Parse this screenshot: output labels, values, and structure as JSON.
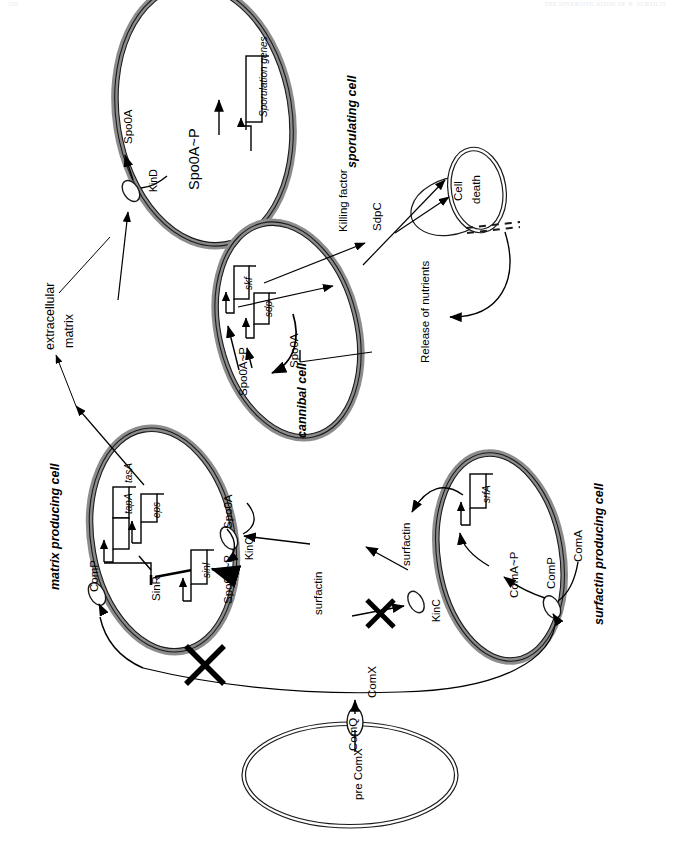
{
  "page": {
    "header_left": "220",
    "header_right": "THE DIVERSIFICATION OF B. SUBTILIS"
  },
  "diagram": {
    "orientation": "rotated-90-ccw",
    "colors": {
      "membrane_fill": "#8c8c8c",
      "membrane_stroke": "#1a1a1a",
      "line": "#000000",
      "background": "#ffffff"
    },
    "cells": [
      {
        "id": "sporulating",
        "title": "sporulating cell",
        "nodes": [
          "Spo0A",
          "KinD",
          "Spo0A~P"
        ],
        "genes": [
          "Sporulation genes"
        ]
      },
      {
        "id": "cannibal",
        "title": "cannibal cell",
        "nodes": [
          "Spo0A~P",
          "Spo0A"
        ],
        "genes": [
          "skf",
          "sdp"
        ]
      },
      {
        "id": "matrix",
        "title": "matrix producing cell",
        "nodes": [
          "ComP",
          "SinR",
          "Spo0A~P",
          "Spo0A",
          "KinC"
        ],
        "genes": [
          "tapA",
          "tasA",
          "eps",
          "sinI"
        ]
      },
      {
        "id": "surfactin",
        "title": "surfactin producing cell",
        "nodes": [
          "surfactin",
          "KinC",
          "ComA~P",
          "ComP",
          "ComA"
        ],
        "genes": [
          "srfA"
        ]
      },
      {
        "id": "dying",
        "title": "",
        "nodes": [
          "Cell",
          "death"
        ],
        "genes": []
      },
      {
        "id": "signalling",
        "title": "",
        "nodes": [
          "pre ComX",
          "ComQ",
          "ComX"
        ],
        "genes": []
      }
    ],
    "labels": {
      "sporulating_cell": "sporulating cell",
      "cannibal_cell": "cannibal cell",
      "matrix_producing_cell": "matrix producing cell",
      "surfactin_producing_cell": "surfactin producing cell",
      "extracellular": "extracellular",
      "matrix": "matrix",
      "spo0a": "Spo0A",
      "spo0a_p": "Spo0A~P",
      "kind": "KinD",
      "kinc": "KinC",
      "sporulation_genes": "Sporulation genes",
      "skf": "skf",
      "sdp": "sdp",
      "killing_factor": "Killing factor",
      "sdpc": "SdpC",
      "cell": "Cell",
      "death": "death",
      "release_of_nutrients": "Release of nutrients",
      "comp": "ComP",
      "tapa": "tapA",
      "tasa": "tasA",
      "eps": "eps",
      "sinr": "SinR",
      "sini": "sinI",
      "surfactin": "surfactin",
      "srfa": "srfA",
      "coma_p": "ComA~P",
      "coma": "ComA",
      "pre_comx": "pre ComX",
      "comq": "ComQ",
      "comx": "ComX"
    },
    "blocked_markers": [
      {
        "name": "comx-to-matrix-blocked",
        "symbol": "X"
      },
      {
        "name": "surfactin-to-kinc-blocked",
        "symbol": "X"
      }
    ]
  }
}
